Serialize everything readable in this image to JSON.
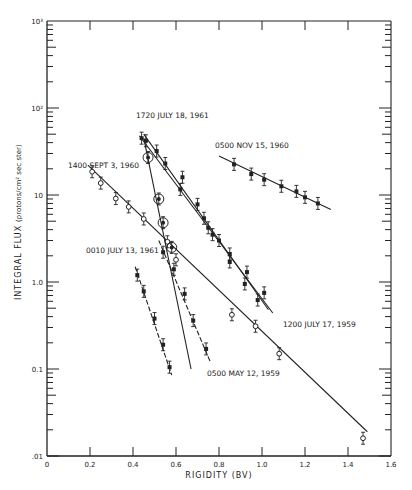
{
  "chart_data": {
    "type": "scatter",
    "title": "",
    "xlabel": "RIGIDITY (BV)",
    "ylabel": "INTEGRAL FLUX (protons/cm² sec ster)",
    "xlim": [
      0,
      1.6
    ],
    "ylim": [
      0.01,
      1000
    ],
    "yscale": "log",
    "grid": false,
    "x_ticks": [
      "0",
      "0.2",
      "0.4",
      "0.6",
      "0.8",
      "1.0",
      "1.2",
      "1.4",
      "1.6"
    ],
    "y_ticks": [
      ".01",
      "0.1",
      "1.0",
      "10",
      "10²",
      "10³"
    ],
    "series": [
      {
        "name": "0500 NOV 15, 1960",
        "marker": "filled",
        "x": [
          0.87,
          0.95,
          1.01,
          1.09,
          1.16,
          1.2,
          1.26
        ],
        "y": [
          22.5,
          17.4,
          15.0,
          12.6,
          11.0,
          9.4,
          8.0
        ],
        "fit": [
          [
            0.8,
            28
          ],
          [
            1.32,
            6.8
          ]
        ]
      },
      {
        "name": "1720 JULY 18, 1961",
        "marker": "filled",
        "x": [
          0.46,
          0.51,
          0.55,
          0.62,
          0.73,
          0.77,
          0.85,
          0.92,
          0.98
        ],
        "y": [
          42,
          32,
          23,
          11.6,
          5.4,
          3.5,
          1.7,
          0.95,
          0.62
        ],
        "fit": [
          [
            0.45,
            50
          ],
          [
            1.03,
            0.48
          ]
        ]
      },
      {
        "name": "1200 JULY 17, 1959",
        "marker": "filled",
        "x": [
          0.44,
          0.63,
          0.7,
          0.75,
          0.8,
          0.85,
          0.93,
          1.01
        ],
        "y": [
          45,
          16,
          7.8,
          4.2,
          3.0,
          2.1,
          1.3,
          0.75
        ],
        "fit": [
          [
            0.43,
            48
          ],
          [
            1.05,
            0.44
          ]
        ]
      },
      {
        "name": "1400 SEPT 3, 1960",
        "marker": "open",
        "x": [
          0.21,
          0.25,
          0.32,
          0.38,
          0.45,
          0.56,
          0.6,
          0.86,
          0.97,
          1.08,
          1.47
        ],
        "y": [
          18.5,
          13.7,
          9.1,
          7.3,
          5.3,
          2.9,
          1.8,
          0.42,
          0.31,
          0.15,
          0.016
        ],
        "fit": [
          [
            0.19,
            22
          ],
          [
            1.49,
            0.019
          ]
        ]
      },
      {
        "name": "circled (1720 JULY 18, 1961 steep)",
        "marker": "circled",
        "x": [
          0.47,
          0.52,
          0.54,
          0.58
        ],
        "y": [
          27,
          9.0,
          4.8,
          2.5
        ],
        "fit": [
          [
            0.45,
            45
          ],
          [
            0.67,
            0.1
          ]
        ]
      },
      {
        "name": "0010 JULY 13, 1961",
        "marker": "filled",
        "x": [
          0.42,
          0.45,
          0.5,
          0.54,
          0.57
        ],
        "y": [
          1.2,
          0.78,
          0.38,
          0.19,
          0.105
        ],
        "fit": [
          [
            0.41,
            1.5
          ],
          [
            0.58,
            0.085
          ]
        ]
      },
      {
        "name": "0500 MAY 12, 1959",
        "marker": "filled",
        "x": [
          0.54,
          0.59,
          0.64,
          0.68,
          0.74
        ],
        "y": [
          2.2,
          1.4,
          0.73,
          0.36,
          0.17
        ],
        "fit": [
          [
            0.52,
            3.0
          ],
          [
            0.76,
            0.12
          ]
        ]
      }
    ],
    "annotations": [
      {
        "text": "1720 JULY 18, 1961"
      },
      {
        "text": "0500 NOV 15, 1960"
      },
      {
        "text": "1400 SEPT 3, 1960"
      },
      {
        "text": "0010 JULY 13, 1961"
      },
      {
        "text": "1200 JULY 17, 1959"
      },
      {
        "text": "0500 MAY 12, 1959"
      }
    ]
  },
  "labels": {
    "xlabel": "RIGIDITY (BV)",
    "ylabel_main": "INTEGRAL FLUX",
    "ylabel_unit": "(protons/cm² sec ster)",
    "x_ticks": [
      "0",
      "0.2",
      "0.4",
      "0.6",
      "0.8",
      "1.0",
      "1.2",
      "1.4",
      "1.6"
    ],
    "y_ticks": [
      ".01",
      "0.1",
      "1.0",
      "10",
      "10²",
      "10³"
    ],
    "ann_july18_1961": "1720 JULY 18, 1961",
    "ann_nov15_1960": "0500 NOV 15, 1960",
    "ann_sept3_1960": "1400 SEPT 3, 1960",
    "ann_july13_1961": "0010 JULY 13, 1961",
    "ann_july17_1959": "1200 JULY 17, 1959",
    "ann_may12_1959": "0500 MAY 12, 1959"
  }
}
